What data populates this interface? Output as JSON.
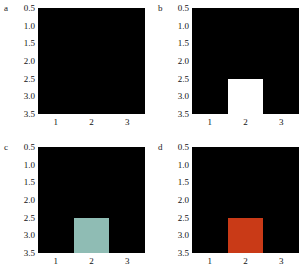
{
  "figure": {
    "background_color": "#ffffff",
    "layout": "2x2",
    "panel_count": 4
  },
  "chart_data": [
    {
      "type": "heatmap",
      "panel_label": "a",
      "title": "",
      "xlabel": "",
      "ylabel": "",
      "background_color": "#000000",
      "xtick_labels": [
        "1",
        "2",
        "3"
      ],
      "ytick_labels": [
        "0.5",
        "1.0",
        "1.5",
        "2.0",
        "2.5",
        "3.0",
        "3.5"
      ],
      "xlim": [
        0.5,
        3.5
      ],
      "ylim": [
        3.5,
        0.5
      ],
      "grid": false,
      "legend": "none",
      "x": [
        1,
        2,
        3
      ],
      "y": [
        1,
        2,
        3
      ],
      "values": [
        [
          0,
          0,
          0
        ],
        [
          0,
          0,
          0
        ],
        [
          0,
          0,
          0
        ]
      ],
      "highlight": null,
      "highlight_color": "#000000",
      "highlight_visible": false
    },
    {
      "type": "heatmap",
      "panel_label": "b",
      "title": "",
      "xlabel": "",
      "ylabel": "",
      "background_color": "#000000",
      "xtick_labels": [
        "1",
        "2",
        "3"
      ],
      "ytick_labels": [
        "0.5",
        "1.0",
        "1.5",
        "2.0",
        "2.5",
        "3.0",
        "3.5"
      ],
      "xlim": [
        0.5,
        3.5
      ],
      "ylim": [
        3.5,
        0.5
      ],
      "grid": false,
      "legend": "none",
      "x": [
        1,
        2,
        3
      ],
      "y": [
        1,
        2,
        3
      ],
      "values": [
        [
          0,
          0,
          0
        ],
        [
          0,
          1,
          0
        ],
        [
          0,
          0,
          0
        ]
      ],
      "highlight": {
        "x_range": [
          1.5,
          2.5
        ],
        "y_range": [
          1.5,
          2.5
        ]
      },
      "highlight_color": "#ffffff",
      "highlight_visible": true
    },
    {
      "type": "heatmap",
      "panel_label": "c",
      "title": "",
      "xlabel": "",
      "ylabel": "",
      "background_color": "#000000",
      "xtick_labels": [
        "1",
        "2",
        "3"
      ],
      "ytick_labels": [
        "0.5",
        "1.0",
        "1.5",
        "2.0",
        "2.5",
        "3.0",
        "3.5"
      ],
      "xlim": [
        0.5,
        3.5
      ],
      "ylim": [
        3.5,
        0.5
      ],
      "grid": false,
      "legend": "none",
      "x": [
        1,
        2,
        3
      ],
      "y": [
        1,
        2,
        3
      ],
      "values": [
        [
          0,
          0,
          0
        ],
        [
          0,
          1,
          0
        ],
        [
          0,
          0,
          0
        ]
      ],
      "highlight": {
        "x_range": [
          1.5,
          2.5
        ],
        "y_range": [
          1.5,
          2.5
        ]
      },
      "highlight_color": "#8fbcb4",
      "highlight_visible": true
    },
    {
      "type": "heatmap",
      "panel_label": "d",
      "title": "",
      "xlabel": "",
      "ylabel": "",
      "background_color": "#000000",
      "xtick_labels": [
        "1",
        "2",
        "3"
      ],
      "ytick_labels": [
        "0.5",
        "1.0",
        "1.5",
        "2.0",
        "2.5",
        "3.0",
        "3.5"
      ],
      "xlim": [
        0.5,
        3.5
      ],
      "ylim": [
        3.5,
        0.5
      ],
      "grid": false,
      "legend": "none",
      "x": [
        1,
        2,
        3
      ],
      "y": [
        1,
        2,
        3
      ],
      "values": [
        [
          0,
          0,
          0
        ],
        [
          0,
          1,
          0
        ],
        [
          0,
          0,
          0
        ]
      ],
      "highlight": {
        "x_range": [
          1.5,
          2.5
        ],
        "y_range": [
          1.5,
          2.5
        ]
      },
      "highlight_color": "#c93a17",
      "highlight_visible": true
    }
  ]
}
